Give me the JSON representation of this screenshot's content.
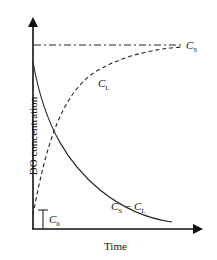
{
  "diagram": {
    "y_axis_label": "DO concentration",
    "x_axis_label": "Time",
    "curves": [
      {
        "name": "C_S",
        "label_main": "C",
        "label_sub": "S",
        "style": "dash-dot",
        "description": "saturation concentration (constant)"
      },
      {
        "name": "C_L",
        "label_main": "C",
        "label_sub": "L",
        "style": "dashed",
        "description": "rising toward C_S"
      },
      {
        "name": "C_S - C_L",
        "label_main": "C",
        "label_sub": "S",
        "label_minus": " − ",
        "label_main2": "C",
        "label_sub2": "L",
        "style": "solid",
        "description": "decaying deficit"
      }
    ],
    "c0": {
      "label_main": "C",
      "label_sub": "0"
    }
  }
}
